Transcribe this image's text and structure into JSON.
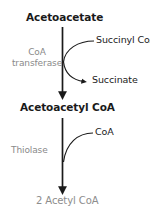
{
  "diagram": {
    "colors": {
      "background": "#ffffff",
      "text_dark": "#1a1a1a",
      "text_gray": "#8a8a8a",
      "arrow": "#1a1a1a"
    },
    "nodes": {
      "acetoacetate": "Acetoacetate",
      "acetoacetyl_coa": "Acetoacetyl CoA",
      "acetyl_coa": "2 Acetyl CoA"
    },
    "step1": {
      "enzyme_line1": "CoA",
      "enzyme_line2": "transferase",
      "substrate_in": "Succinyl CoA",
      "product_out": "Succinate"
    },
    "step2": {
      "enzyme": "Thiolase",
      "substrate_in": "CoA"
    }
  }
}
